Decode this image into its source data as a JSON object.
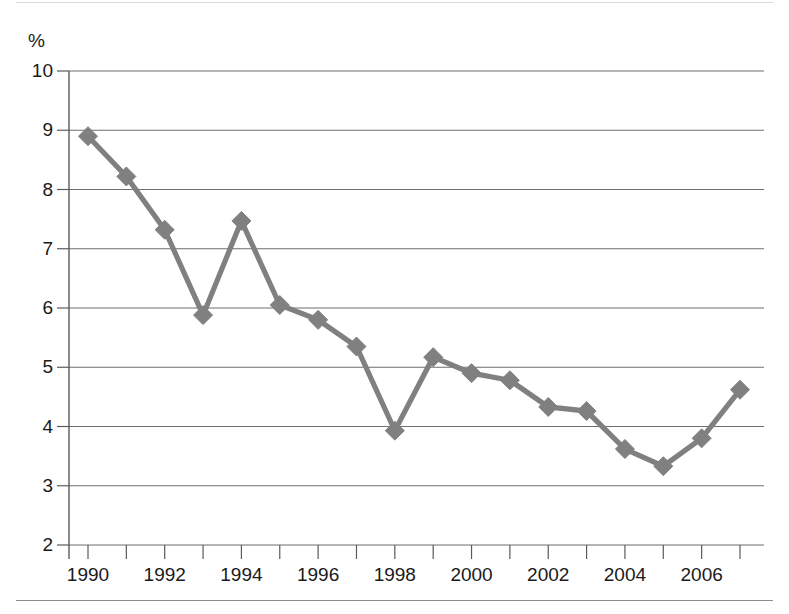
{
  "chart_data": {
    "type": "line",
    "title": "",
    "subtitle": "",
    "xlabel": "",
    "ylabel": "%",
    "unit_label": "%",
    "x": [
      1990,
      1991,
      1992,
      1993,
      1994,
      1995,
      1996,
      1997,
      1998,
      1999,
      2000,
      2001,
      2002,
      2003,
      2004,
      2005,
      2006,
      2007
    ],
    "values": [
      8.9,
      8.22,
      7.32,
      5.88,
      7.47,
      6.05,
      5.8,
      5.35,
      3.93,
      5.17,
      4.9,
      4.78,
      4.33,
      4.26,
      3.62,
      3.33,
      3.8,
      4.62
    ],
    "series": [
      {
        "name": "rate",
        "values": [
          8.9,
          8.22,
          7.32,
          5.88,
          7.47,
          6.05,
          5.8,
          5.35,
          3.93,
          5.17,
          4.9,
          4.78,
          4.33,
          4.26,
          3.62,
          3.33,
          3.8,
          4.62
        ]
      }
    ],
    "ylim": [
      2,
      10
    ],
    "xlim": [
      1989.5,
      2007.5
    ],
    "ytick_labels": [
      "10",
      "9",
      "8",
      "7",
      "6",
      "5",
      "4",
      "3",
      "2"
    ],
    "ytick_values": [
      10,
      9,
      8,
      7,
      6,
      5,
      4,
      3,
      2
    ],
    "xtick_values": [
      1990,
      1991,
      1992,
      1993,
      1994,
      1995,
      1996,
      1997,
      1998,
      1999,
      2000,
      2001,
      2002,
      2003,
      2004,
      2005,
      2006,
      2007
    ],
    "xtick_labels": [
      "1990",
      "",
      "1992",
      "",
      "1994",
      "",
      "1996",
      "",
      "1998",
      "",
      "2000",
      "",
      "2002",
      "",
      "2004",
      "",
      "2006",
      ""
    ],
    "xtick_labels_shown": [
      "1990",
      "1992",
      "1994",
      "1996",
      "1998",
      "2000",
      "2002",
      "2004",
      "2006"
    ],
    "grid": true,
    "grid_axis": "y",
    "legend": false,
    "legend_position": "none",
    "marker": "diamond",
    "series_color": "#808080",
    "grid_color": "#6e6e6e",
    "axis_color": "#5a5a5a"
  },
  "colors": {
    "background": "#ffffff",
    "line": "#808080",
    "marker": "#808080",
    "grid": "#6e6e6e",
    "axis": "#5a5a5a",
    "text": "#1a1a1a",
    "rule_top": "#d8d8d8",
    "rule_bottom": "#8c8c8c"
  }
}
